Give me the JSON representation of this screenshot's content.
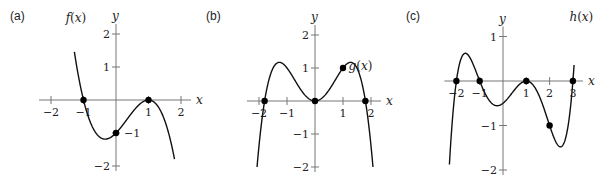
{
  "chart_data": [
    {
      "id": "a",
      "type": "line",
      "panel_label": "(a)",
      "function_label": "f(x)",
      "xlabel": "x",
      "ylabel": "y",
      "xlim": [
        -2,
        2
      ],
      "ylim": [
        -2,
        2
      ],
      "x_ticks": [
        -2,
        -1,
        1,
        2
      ],
      "x_tick_labels": [
        "−2",
        "−1",
        "1",
        "2"
      ],
      "y_ticks": [
        2,
        1,
        -1,
        -2
      ],
      "y_tick_labels": [
        "2",
        "1",
        "−1",
        "−2"
      ],
      "grid": false,
      "formula": "-(x+1)(x-1)^2",
      "marked_points": [
        [
          -1,
          0
        ],
        [
          0,
          -1
        ],
        [
          1,
          0
        ]
      ],
      "curve_x_range": [
        -1.28,
        1.8
      ],
      "frame": {
        "ox": 116,
        "oy": 100,
        "ux": 32.5,
        "uy": 33,
        "label_x": 10,
        "label_y": 20
      }
    },
    {
      "id": "b",
      "type": "line",
      "panel_label": "(b)",
      "function_label": "g(x)",
      "xlabel": "x",
      "ylabel": "y",
      "xlim": [
        -2,
        2
      ],
      "ylim": [
        -2,
        2
      ],
      "x_ticks": [
        -2,
        -1,
        1,
        2
      ],
      "x_tick_labels": [
        "−2",
        "−1",
        "1",
        "2"
      ],
      "y_ticks": [
        2,
        1,
        -1,
        -2
      ],
      "y_tick_labels": [
        "2",
        "1",
        "−1",
        "−2"
      ],
      "grid": false,
      "formula": "x^2(3.24 - x^2)/2.24",
      "marked_points": [
        [
          -1.8,
          0
        ],
        [
          0,
          0
        ],
        [
          1,
          1
        ],
        [
          1.8,
          0
        ]
      ],
      "curve_x_range": [
        -2.07,
        2.07
      ],
      "frame": {
        "ox": 315,
        "oy": 101,
        "ux": 28,
        "uy": 33,
        "label_x": 206,
        "label_y": 20
      }
    },
    {
      "id": "c",
      "type": "line",
      "panel_label": "(c)",
      "function_label": "h(x)",
      "xlabel": "x",
      "ylabel": "y",
      "xlim": [
        -2,
        3
      ],
      "ylim": [
        -2,
        1
      ],
      "x_ticks": [
        -2,
        -1,
        1,
        2,
        3
      ],
      "x_tick_labels": [
        "−2",
        "−1",
        "1",
        "2",
        "3"
      ],
      "y_ticks": [
        1,
        -1,
        -2
      ],
      "y_tick_labels": [
        "1",
        "−1",
        "−2"
      ],
      "grid": false,
      "formula": "(x+2)(x+1)(x-1)^2(x-3)/12",
      "marked_points": [
        [
          -2,
          0
        ],
        [
          -1,
          0
        ],
        [
          1,
          0
        ],
        [
          2,
          -1
        ],
        [
          3,
          0
        ]
      ],
      "curve_x_range": [
        -2.3,
        3.05
      ],
      "frame": {
        "ox": 503,
        "oy": 81,
        "ux": 23.3,
        "uy": 44.5,
        "label_x": 406,
        "label_y": 20
      }
    }
  ]
}
